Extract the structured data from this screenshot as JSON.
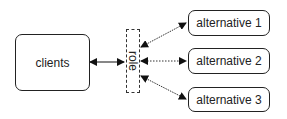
{
  "diagram": {
    "nodes": {
      "clients": {
        "label": "clients"
      },
      "role": {
        "label": "role"
      },
      "alternatives": [
        {
          "label": "alternative 1"
        },
        {
          "label": "alternative 2"
        },
        {
          "label": "alternative 3"
        }
      ]
    },
    "edges": [
      {
        "from": "clients",
        "to": "role",
        "style": "solid",
        "bidirectional": true
      },
      {
        "from": "role",
        "to": "alternative 1",
        "style": "dotted",
        "bidirectional": true
      },
      {
        "from": "role",
        "to": "alternative 2",
        "style": "dotted",
        "bidirectional": true
      },
      {
        "from": "role",
        "to": "alternative 3",
        "style": "dotted",
        "bidirectional": true
      }
    ]
  }
}
